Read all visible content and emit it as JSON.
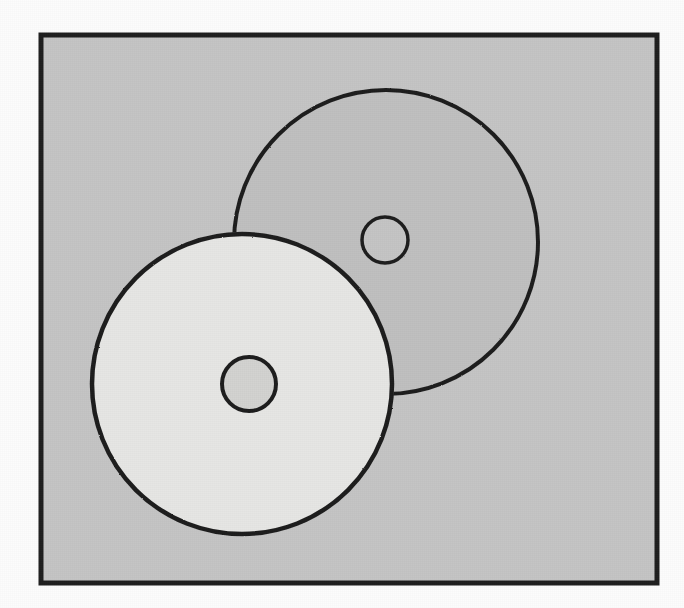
{
  "figure": {
    "type": "line-drawing",
    "background_color": "#fcfcfc",
    "panel": {
      "name": "bordered-panel",
      "fill_color": "#c4c4c4",
      "border_color": "#1e1e1e",
      "border_width": 5,
      "x": 3,
      "y": 3,
      "width": 616,
      "height": 548
    },
    "shapes": [
      {
        "id": "back-disc",
        "label": "Back disc (upper right, darker gray)",
        "role": "overlapped-disc",
        "shape": "circle",
        "cx": 348,
        "cy": 210,
        "r": 152,
        "fill_color": "#bfbfbf",
        "stroke_color": "#1e1e1e",
        "stroke_width": 4
      },
      {
        "id": "back-disc-hole",
        "label": "Back disc center hole",
        "role": "center-hole",
        "shape": "circle",
        "cx": 347,
        "cy": 208,
        "r": 23,
        "fill_color": "#c4c4c4",
        "stroke_color": "#1e1e1e",
        "stroke_width": 3.5
      },
      {
        "id": "front-disc",
        "label": "Front disc (lower left, lighter gray)",
        "role": "overlapping-disc",
        "shape": "circle",
        "cx": 204,
        "cy": 352,
        "r": 150,
        "fill_color": "#e6e6e4",
        "stroke_color": "#1e1e1e",
        "stroke_width": 4.5
      },
      {
        "id": "front-disc-hole",
        "label": "Front disc center hole",
        "role": "center-hole",
        "shape": "circle",
        "cx": 211,
        "cy": 352,
        "r": 27,
        "fill_color": "#d2d2d0",
        "stroke_color": "#1e1e1e",
        "stroke_width": 4
      }
    ],
    "palette": {
      "ink": "#1e1e1e",
      "panel_gray": "#c4c4c4",
      "back_disc_gray": "#bfbfbf",
      "front_disc_gray": "#e6e6e4",
      "paper_white": "#fcfcfc"
    }
  }
}
